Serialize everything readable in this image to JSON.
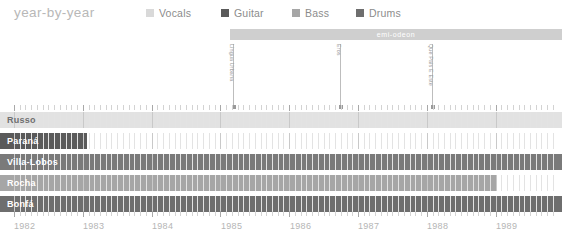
{
  "header": {
    "title": "year-by-year",
    "legend": [
      {
        "label": "Vocals",
        "color": "#d9d9d9",
        "x": 146
      },
      {
        "label": "Guitar",
        "color": "#5a5a5a",
        "x": 221
      },
      {
        "label": "Bass",
        "color": "#a6a6a6",
        "x": 292
      },
      {
        "label": "Drums",
        "color": "#6e6e6e",
        "x": 356
      }
    ]
  },
  "period_band": {
    "label": "emi-odeon",
    "color": "#cfcfcf",
    "x": 230,
    "y": 29,
    "width": 332
  },
  "annotations": [
    {
      "label": "Lingua Urbana",
      "x": 233
    },
    {
      "label": "Eros",
      "x": 340
    },
    {
      "label": "Que Pais E Este",
      "x": 432
    }
  ],
  "chart_data": {
    "type": "bar",
    "title": "year-by-year",
    "xlabel": "",
    "ylabel": "",
    "orientation": "horizontal-timeline",
    "xlim": [
      1982,
      1989.85
    ],
    "grid": true,
    "legend_position": "top",
    "axis_years": [
      "1982",
      "1983",
      "1984",
      "1985",
      "1986",
      "1987",
      "1988",
      "1989"
    ],
    "axis_year_x": [
      14,
      83,
      152,
      221,
      290,
      358,
      427,
      496
    ],
    "categories": [
      "Russo",
      "Paraná",
      "Villa-Lobos",
      "Rocha",
      "Bonfá"
    ],
    "series": [
      {
        "name": "Russo",
        "role": "Vocals",
        "color": "#e2e2e2",
        "label_color": "#6f6f6f",
        "start_year": 1982.0,
        "end_year": 1989.85,
        "px_start": 0,
        "px_end": 562,
        "row_y": 7
      },
      {
        "name": "Paraná",
        "role": "Guitar",
        "color": "#5a5a5a",
        "label_color": "#ffffff",
        "start_year": 1982.0,
        "end_year": 1983.0,
        "px_start": 0,
        "px_end": 87,
        "row_y": 28
      },
      {
        "name": "Villa-Lobos",
        "role": "Guitar",
        "color": "#7a7a7a",
        "label_color": "#ffffff",
        "start_year": 1982.0,
        "end_year": 1989.85,
        "px_start": 0,
        "px_end": 562,
        "row_y": 49
      },
      {
        "name": "Rocha",
        "role": "Bass",
        "color": "#a6a6a6",
        "label_color": "#ffffff",
        "start_year": 1982.0,
        "end_year": 1989.0,
        "px_start": 0,
        "px_end": 496,
        "row_y": 70
      },
      {
        "name": "Bonfá",
        "role": "Drums",
        "color": "#6e6e6e",
        "label_color": "#ffffff",
        "start_year": 1982.0,
        "end_year": 1989.85,
        "px_start": 0,
        "px_end": 562,
        "row_y": 91
      }
    ]
  }
}
